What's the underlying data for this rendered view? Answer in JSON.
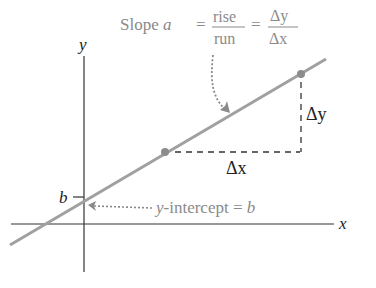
{
  "diagram": {
    "axes": {
      "x_label": "x",
      "y_label": "y"
    },
    "slope_label": {
      "prefix": "Slope ",
      "variable": "a",
      "equals": "=",
      "frac1_num": "rise",
      "frac1_den": "run",
      "frac2_num": "Δy",
      "frac2_den": "Δx"
    },
    "intercept_label": {
      "text_prefix": "y",
      "text_rest": "-intercept = ",
      "variable": "b"
    },
    "b_tick_label": "b",
    "delta_x_label": "Δx",
    "delta_y_label": "Δy",
    "colors": {
      "line": "#999999",
      "axis": "#333333",
      "annotation": "#8a8a8a",
      "point": "#8c8c8c",
      "text": "#222222"
    }
  }
}
